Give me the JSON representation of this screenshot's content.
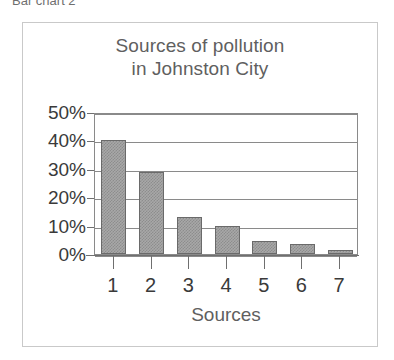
{
  "caption": {
    "text": "Bar chart 2"
  },
  "chart_data": {
    "type": "bar",
    "title": "Sources of pollution in Johnston City",
    "title_lines": [
      "Sources of pollution",
      "in Johnston City"
    ],
    "categories": [
      "1",
      "2",
      "3",
      "4",
      "5",
      "6",
      "7"
    ],
    "values": [
      40,
      29,
      13,
      10,
      4.5,
      3.5,
      1.5
    ],
    "xlabel": "Sources",
    "ylabel": "",
    "ylim": [
      0,
      50
    ],
    "ytick_values": [
      0,
      10,
      20,
      30,
      40,
      50
    ],
    "ytick_labels": [
      "0%",
      "10%",
      "20%",
      "30%",
      "40%",
      "50%"
    ],
    "grid": true,
    "legend": false,
    "value_suffix": "%",
    "colors": {
      "bar_fill": "#a8a8a8",
      "bar_pattern": "#8d8d8d",
      "bar_border": "#6a6a6a",
      "gridline": "#8a8a8a",
      "axis": "#6f6f6f",
      "tick_text": "#3a3a3a",
      "title_text": "#5f5f5f",
      "frame": "#c9c9c9",
      "background": "#ffffff"
    }
  }
}
